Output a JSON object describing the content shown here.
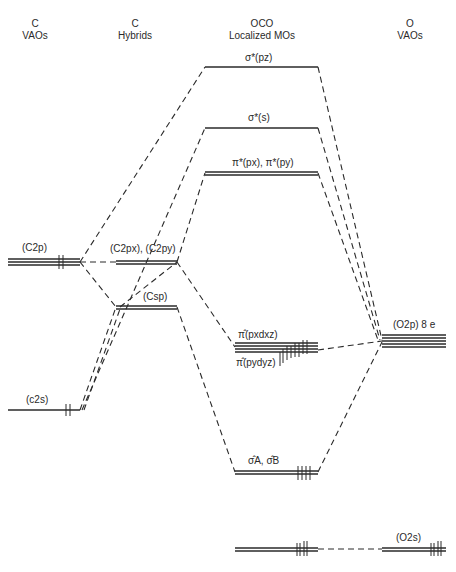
{
  "headers": {
    "c_vaos": {
      "line1": "C",
      "line2": "VAOs"
    },
    "c_hybrids": {
      "line1": "C",
      "line2": "Hybrids"
    },
    "oco_mos": {
      "line1": "OCO",
      "line2": "Localized MOs"
    },
    "o_vaos": {
      "line1": "O",
      "line2": "VAOs"
    }
  },
  "levels": {
    "sigma_star_pz": "σ*(pz)",
    "sigma_star_s": "σ*(s)",
    "pi_star": "π*(px), π*(py)",
    "c2p": "(C2p)",
    "c2px_c2py": "(C2px), (C2py)",
    "csp": "(Csp)",
    "c2s": "(c2s)",
    "pi_hat_pxdxz": "π̂(pxdxz)",
    "pi_hat_pydyz": "π̂(pydyz)",
    "o2p": "(O2p) 8 e",
    "sigma_hat_ab": "σ̂A, σ̂B",
    "o2s": "(O2s)"
  },
  "colors": {
    "line": "#2a2a2a",
    "background": "#ffffff"
  }
}
